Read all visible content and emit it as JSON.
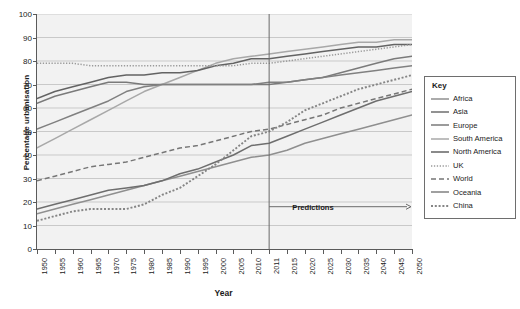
{
  "chart_data": {
    "type": "line",
    "title": "",
    "xlabel": "Year",
    "ylabel": "Percentage urbanisation",
    "xlim": [
      1950,
      2050
    ],
    "ylim": [
      0,
      100
    ],
    "grid": true,
    "legend_position": "right",
    "legend_title": "Key",
    "x_tick_labels": [
      "1950",
      "1955",
      "1960",
      "1965",
      "1970",
      "1975",
      "1980",
      "1985",
      "1990",
      "1995",
      "2000",
      "2005",
      "2010",
      "2011",
      "2015",
      "2020",
      "2025",
      "2030",
      "2035",
      "2040",
      "2045",
      "2050"
    ],
    "y_tick_labels": [
      "0",
      "10",
      "20",
      "30",
      "40",
      "50",
      "60",
      "70",
      "80",
      "90",
      "100"
    ],
    "annotations": [
      {
        "text": "Predictions",
        "x_start": 2011,
        "x_end": 2050,
        "y": 18,
        "style": "arrow-right"
      }
    ],
    "divider_year": 2011,
    "x": [
      1950,
      1955,
      1960,
      1965,
      1970,
      1975,
      1980,
      1985,
      1990,
      1995,
      2000,
      2005,
      2010,
      2011,
      2015,
      2020,
      2025,
      2030,
      2035,
      2040,
      2045,
      2050
    ],
    "series": [
      {
        "name": "Africa",
        "color": "#8f8f8f",
        "style": "solid",
        "values": [
          15,
          17,
          19,
          21,
          23,
          25,
          27,
          29,
          31,
          33,
          35,
          37,
          39,
          40,
          42,
          45,
          47,
          49,
          51,
          53,
          55,
          57
        ]
      },
      {
        "name": "Asia",
        "color": "#6e6e6e",
        "style": "solid",
        "values": [
          17,
          19,
          21,
          23,
          25,
          26,
          27,
          29,
          32,
          34,
          37,
          40,
          44,
          45,
          48,
          51,
          54,
          57,
          60,
          63,
          65,
          67
        ]
      },
      {
        "name": "Europe",
        "color": "#7a7a7a",
        "style": "solid",
        "values": [
          62,
          65,
          67,
          69,
          71,
          71,
          70,
          70,
          70,
          70,
          70,
          70,
          70,
          70,
          71,
          72,
          73,
          75,
          77,
          79,
          81,
          82
        ]
      },
      {
        "name": "South America",
        "color": "#a8a8a8",
        "style": "solid",
        "values": [
          43,
          47,
          51,
          55,
          59,
          63,
          67,
          70,
          73,
          76,
          79,
          81,
          82,
          83,
          84,
          85,
          86,
          87,
          88,
          88,
          89,
          89
        ]
      },
      {
        "name": "North America",
        "color": "#636363",
        "style": "solid",
        "values": [
          64,
          67,
          69,
          71,
          73,
          74,
          74,
          75,
          75,
          76,
          78,
          79,
          81,
          81,
          82,
          83,
          84,
          85,
          86,
          86,
          87,
          87
        ]
      },
      {
        "name": "UK",
        "color": "#9a9a9a",
        "style": "dotted-fine",
        "values": [
          79,
          79,
          79,
          78,
          78,
          78,
          78,
          78,
          78,
          78,
          78,
          78,
          79,
          79,
          80,
          81,
          82,
          83,
          84,
          85,
          86,
          87
        ]
      },
      {
        "name": "World",
        "color": "#767676",
        "style": "dashed",
        "values": [
          29,
          31,
          33,
          35,
          36,
          37,
          39,
          41,
          43,
          44,
          46,
          48,
          50,
          51,
          53,
          55,
          57,
          60,
          62,
          64,
          66,
          68
        ]
      },
      {
        "name": "Oceania",
        "color": "#808080",
        "style": "solid",
        "values": [
          51,
          54,
          57,
          60,
          63,
          67,
          69,
          70,
          70,
          70,
          70,
          70,
          70,
          71,
          71,
          72,
          73,
          74,
          75,
          76,
          77,
          78
        ]
      },
      {
        "name": "China",
        "color": "#858585",
        "style": "dotted-coarse",
        "values": [
          12,
          14,
          16,
          17,
          17,
          17,
          19,
          23,
          26,
          31,
          36,
          42,
          48,
          50,
          54,
          59,
          62,
          65,
          68,
          70,
          72,
          74
        ]
      }
    ]
  }
}
